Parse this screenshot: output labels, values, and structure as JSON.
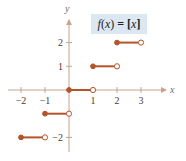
{
  "chart_data": {
    "type": "line",
    "title": "f(x) = [x]",
    "title_parts": {
      "func": "f",
      "arg": "x",
      "eq": " = ",
      "open": "[",
      "var": "x",
      "close": "]"
    },
    "xlabel": "x",
    "ylabel": "y",
    "xlim": [
      -2.2,
      3.5
    ],
    "ylim": [
      -2.5,
      2.9
    ],
    "x_ticks": [
      -2,
      -1,
      1,
      2,
      3
    ],
    "x_tick_labels": [
      "−2",
      "−1",
      "1",
      "2",
      "3"
    ],
    "y_ticks": [
      -2,
      1,
      2
    ],
    "y_tick_labels": [
      "−2",
      "1",
      "2"
    ],
    "grid": false,
    "series": [
      {
        "name": "greatest integer function",
        "segments": [
          {
            "x_start": -2,
            "x_end": -1,
            "y": -2,
            "start_closed": true,
            "end_closed": false
          },
          {
            "x_start": -1,
            "x_end": 0,
            "y": -1,
            "start_closed": true,
            "end_closed": false
          },
          {
            "x_start": 0,
            "x_end": 1,
            "y": 0,
            "start_closed": true,
            "end_closed": false
          },
          {
            "x_start": 1,
            "x_end": 2,
            "y": 1,
            "start_closed": true,
            "end_closed": false
          },
          {
            "x_start": 2,
            "x_end": 3,
            "y": 2,
            "start_closed": true,
            "end_closed": false
          }
        ]
      }
    ],
    "colors": {
      "step": "#b5532a",
      "axis": "#c9a38d",
      "label_box": "#dbe8f4"
    }
  }
}
